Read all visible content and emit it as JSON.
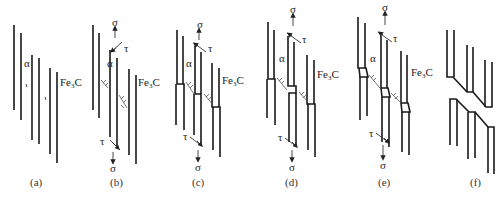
{
  "figure": {
    "panels": [
      {
        "id": "a",
        "caption": "(a)",
        "phase_alpha": "α",
        "phase_carbide": "Fe",
        "carbide_sub": "3",
        "carbide_tail": "C"
      },
      {
        "id": "b",
        "caption": "(b)",
        "phase_alpha": "α",
        "phase_carbide": "Fe",
        "carbide_sub": "3",
        "carbide_tail": "C",
        "stress_top": "σ",
        "shear_top": "τ",
        "stress_bottom": "σ",
        "shear_bottom": "τ"
      },
      {
        "id": "c",
        "caption": "(c)",
        "phase_alpha": "α",
        "phase_carbide": "Fe",
        "carbide_sub": "3",
        "carbide_tail": "C",
        "stress_top": "σ",
        "shear_top": "τ",
        "stress_bottom": "σ",
        "shear_bottom": "τ"
      },
      {
        "id": "d",
        "caption": "(d)",
        "phase_alpha": "α",
        "phase_carbide": "Fe",
        "carbide_sub": "3",
        "carbide_tail": "C",
        "stress_top": "σ",
        "shear_top": "τ",
        "stress_bottom": "σ",
        "shear_bottom": "τ"
      },
      {
        "id": "e",
        "caption": "(e)",
        "phase_alpha": "α",
        "phase_carbide": "Fe",
        "carbide_sub": "3",
        "carbide_tail": "C",
        "stress_top": "σ",
        "shear_top": "τ",
        "stress_bottom": "σ",
        "shear_bottom": "τ"
      },
      {
        "id": "f",
        "caption": "(f)"
      }
    ]
  }
}
